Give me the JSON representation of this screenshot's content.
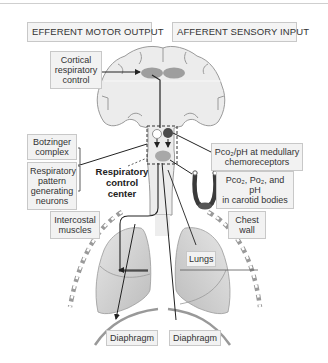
{
  "headers": {
    "efferent": "EFFERENT MOTOR OUTPUT",
    "afferent": "AFFERENT SENSORY INPUT"
  },
  "labels": {
    "cortical_1": "Cortical",
    "cortical_2": "respiratory",
    "cortical_3": "control",
    "botzinger_1": "Botzinger",
    "botzinger_2": "complex",
    "rpgn_1": "Respiratory",
    "rpgn_2": "pattern",
    "rpgn_3": "generating",
    "rpgn_4": "neurons",
    "rcc_1": "Respiratory",
    "rcc_2": "control",
    "rcc_3": "center",
    "medullary_1": "Pco₂/pH at medullary",
    "medullary_2": "chemoreceptors",
    "carotid_1": "Pco₂, Po₂, and pH",
    "carotid_2": "in carotid bodies",
    "intercostal_1": "Intercostal",
    "intercostal_2": "muscles",
    "chest_1": "Chest",
    "chest_2": "wall",
    "lungs": "Lungs",
    "diaphragm_left": "Diaphragm",
    "diaphragm_right": "Diaphragm"
  },
  "colors": {
    "brain_fill": "#ececec",
    "brain_outline": "#9a9a9a",
    "cortex_spot": "#9e9e9e",
    "chemoreceptor_dark": "#4a4a4a",
    "lung_fill": "#cfcfcf",
    "line": "#222222",
    "label_bg": "#f2f2f2"
  }
}
